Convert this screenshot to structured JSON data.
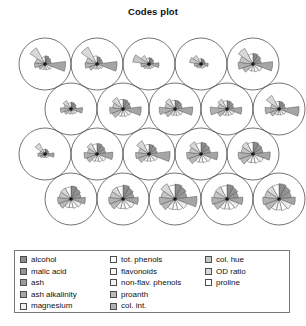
{
  "title": "Codes plot",
  "plot": {
    "type": "som-codes-plot",
    "grid_topology": "hexagonal",
    "grid_rows": 4,
    "grid_cols": 5,
    "unit_count": 20,
    "segment_count": 13,
    "circle_stroke": "#3a3a3a",
    "segment_stroke": "#4a4a4a",
    "background": "#ffffff"
  },
  "legend": {
    "columns": [
      {
        "items": [
          {
            "label": "alcohol",
            "color": "#8c8c8c"
          },
          {
            "label": "malic acid",
            "color": "#949494"
          },
          {
            "label": "ash",
            "color": "#9c9c9c"
          },
          {
            "label": "ash alkalinity",
            "color": "#a5a5a5"
          },
          {
            "label": "magnesium",
            "color": "#eeeeee"
          }
        ]
      },
      {
        "items": [
          {
            "label": "tot. phenols",
            "color": "#ffffff"
          },
          {
            "label": "flavonoids",
            "color": "#fafafa"
          },
          {
            "label": "non-flav. phenols",
            "color": "#f2f2f2"
          },
          {
            "label": "proanth",
            "color": "#b9b9b9"
          },
          {
            "label": "col. int.",
            "color": "#b0b0b0"
          }
        ]
      },
      {
        "items": [
          {
            "label": "col. hue",
            "color": "#c6c6c6"
          },
          {
            "label": "OD ratio",
            "color": "#d9d9d9"
          },
          {
            "label": "proline",
            "color": "#ffffff"
          }
        ]
      }
    ]
  },
  "chart_data": {
    "type": "radar",
    "title": "Codes plot",
    "variables": [
      "alcohol",
      "malic acid",
      "ash",
      "ash alkalinity",
      "magnesium",
      "tot. phenols",
      "flavonoids",
      "non-flav. phenols",
      "proanth",
      "col. int.",
      "col. hue",
      "OD ratio",
      "proline"
    ],
    "segment_colors": [
      "#8c8c8c",
      "#949494",
      "#9c9c9c",
      "#a5a5a5",
      "#eeeeee",
      "#ffffff",
      "#fafafa",
      "#f2f2f2",
      "#b9b9b9",
      "#b0b0b0",
      "#c6c6c6",
      "#d9d9d9",
      "#ffffff"
    ],
    "grid": {
      "rows": 4,
      "cols": 5,
      "topology": "hexagonal",
      "offset_rows": [
        1,
        3
      ]
    },
    "units": [
      {
        "id": 1,
        "row": 0,
        "col": 0,
        "cx": 45.0,
        "cy": 36.0,
        "values": [
          0.34,
          0.3,
          0.26,
          0.86,
          0.3,
          0.26,
          0.22,
          0.24,
          0.3,
          0.44,
          0.4,
          0.76,
          0.3
        ]
      },
      {
        "id": 2,
        "row": 0,
        "col": 1,
        "cx": 97.0,
        "cy": 36.0,
        "values": [
          0.3,
          0.26,
          0.24,
          0.84,
          0.26,
          0.22,
          0.2,
          0.22,
          0.36,
          0.5,
          0.46,
          0.8,
          0.34
        ]
      },
      {
        "id": 3,
        "row": 0,
        "col": 2,
        "cx": 149.0,
        "cy": 36.0,
        "values": [
          0.26,
          0.24,
          0.2,
          0.42,
          0.22,
          0.2,
          0.18,
          0.2,
          0.26,
          0.34,
          0.68,
          0.4,
          0.24
        ]
      },
      {
        "id": 4,
        "row": 0,
        "col": 3,
        "cx": 201.0,
        "cy": 36.0,
        "values": [
          0.22,
          0.2,
          0.18,
          0.3,
          0.2,
          0.18,
          0.16,
          0.18,
          0.22,
          0.28,
          0.48,
          0.4,
          0.22
        ]
      },
      {
        "id": 5,
        "row": 0,
        "col": 4,
        "cx": 253.0,
        "cy": 36.0,
        "values": [
          0.44,
          0.4,
          0.34,
          0.82,
          0.4,
          0.34,
          0.3,
          0.3,
          0.46,
          0.62,
          0.56,
          0.74,
          0.42
        ]
      },
      {
        "id": 6,
        "row": 1,
        "col": 0,
        "cx": 71.0,
        "cy": 81.0,
        "values": [
          0.28,
          0.26,
          0.22,
          0.48,
          0.26,
          0.22,
          0.2,
          0.22,
          0.3,
          0.44,
          0.3,
          0.4,
          0.26
        ]
      },
      {
        "id": 7,
        "row": 1,
        "col": 1,
        "cx": 123.0,
        "cy": 81.0,
        "values": [
          0.4,
          0.36,
          0.32,
          0.76,
          0.36,
          0.32,
          0.3,
          0.32,
          0.48,
          0.56,
          0.44,
          0.54,
          0.4
        ]
      },
      {
        "id": 8,
        "row": 1,
        "col": 2,
        "cx": 175.0,
        "cy": 81.0,
        "values": [
          0.36,
          0.34,
          0.3,
          0.74,
          0.34,
          0.3,
          0.26,
          0.28,
          0.44,
          0.66,
          0.42,
          0.48,
          0.36
        ]
      },
      {
        "id": 9,
        "row": 1,
        "col": 3,
        "cx": 227.0,
        "cy": 81.0,
        "values": [
          0.34,
          0.32,
          0.28,
          0.62,
          0.32,
          0.28,
          0.26,
          0.28,
          0.42,
          0.7,
          0.38,
          0.46,
          0.34
        ]
      },
      {
        "id": 10,
        "row": 1,
        "col": 4,
        "cx": 279.0,
        "cy": 81.0,
        "values": [
          0.32,
          0.3,
          0.26,
          0.84,
          0.3,
          0.26,
          0.24,
          0.26,
          0.4,
          0.58,
          0.36,
          0.64,
          0.32
        ]
      },
      {
        "id": 11,
        "row": 2,
        "col": 0,
        "cx": 45.0,
        "cy": 126.0,
        "values": [
          0.2,
          0.18,
          0.16,
          0.38,
          0.18,
          0.16,
          0.14,
          0.16,
          0.22,
          0.3,
          0.22,
          0.5,
          0.2
        ]
      },
      {
        "id": 12,
        "row": 2,
        "col": 1,
        "cx": 97.0,
        "cy": 126.0,
        "values": [
          0.44,
          0.4,
          0.36,
          0.66,
          0.4,
          0.34,
          0.3,
          0.32,
          0.46,
          0.54,
          0.4,
          0.5,
          0.42
        ]
      },
      {
        "id": 13,
        "row": 2,
        "col": 2,
        "cx": 149.0,
        "cy": 126.0,
        "values": [
          0.4,
          0.38,
          0.34,
          0.88,
          0.38,
          0.32,
          0.3,
          0.32,
          0.48,
          0.56,
          0.44,
          0.62,
          0.4
        ]
      },
      {
        "id": 14,
        "row": 2,
        "col": 3,
        "cx": 201.0,
        "cy": 126.0,
        "values": [
          0.48,
          0.44,
          0.4,
          0.7,
          0.44,
          0.38,
          0.34,
          0.36,
          0.54,
          0.6,
          0.48,
          0.58,
          0.46
        ]
      },
      {
        "id": 15,
        "row": 2,
        "col": 4,
        "cx": 253.0,
        "cy": 126.0,
        "values": [
          0.5,
          0.46,
          0.42,
          0.72,
          0.46,
          0.4,
          0.36,
          0.38,
          0.56,
          0.62,
          0.5,
          0.56,
          0.48
        ]
      },
      {
        "id": 16,
        "row": 3,
        "col": 0,
        "cx": 71.0,
        "cy": 171.0,
        "values": [
          0.54,
          0.48,
          0.42,
          0.6,
          0.46,
          0.4,
          0.36,
          0.38,
          0.52,
          0.56,
          0.5,
          0.52,
          0.5
        ]
      },
      {
        "id": 17,
        "row": 3,
        "col": 1,
        "cx": 123.0,
        "cy": 171.0,
        "values": [
          0.58,
          0.52,
          0.46,
          0.64,
          0.5,
          0.44,
          0.4,
          0.42,
          0.56,
          0.6,
          0.54,
          0.56,
          0.54
        ]
      },
      {
        "id": 18,
        "row": 3,
        "col": 2,
        "cx": 175.0,
        "cy": 171.0,
        "values": [
          0.62,
          0.56,
          0.5,
          0.92,
          0.54,
          0.48,
          0.44,
          0.46,
          0.6,
          0.66,
          0.58,
          0.72,
          0.58
        ]
      },
      {
        "id": 19,
        "row": 3,
        "col": 3,
        "cx": 227.0,
        "cy": 171.0,
        "values": [
          0.6,
          0.54,
          0.48,
          0.66,
          0.52,
          0.46,
          0.42,
          0.44,
          0.58,
          0.64,
          0.56,
          0.58,
          0.56
        ]
      },
      {
        "id": 20,
        "row": 3,
        "col": 4,
        "cx": 279.0,
        "cy": 171.0,
        "values": [
          0.64,
          0.58,
          0.52,
          0.68,
          0.56,
          0.5,
          0.46,
          0.48,
          0.62,
          0.68,
          0.6,
          0.6,
          0.6
        ]
      }
    ],
    "unit_radius": 26.0,
    "max_petal": 24.0
  }
}
